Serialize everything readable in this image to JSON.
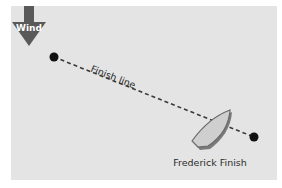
{
  "diagram": {
    "wind": {
      "label": "Wind",
      "icon": "down-arrow-icon",
      "color": "#595959"
    },
    "finish_line": {
      "label": "Finish line"
    },
    "boat": {
      "label": "Frederick Finish"
    },
    "colors": {
      "background": "#e4e4e4",
      "marks": "#111111",
      "boat_fill": "#cfcfcf",
      "boat_outline": "#6a6a6a"
    }
  }
}
